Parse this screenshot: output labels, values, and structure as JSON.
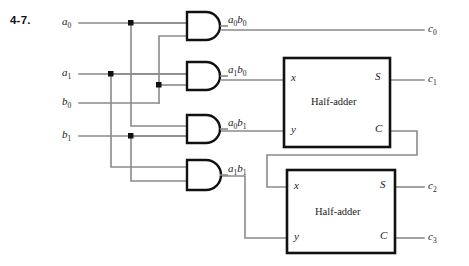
{
  "figure": {
    "problem_number": "4-7.",
    "wire_color": "#8a8a8a",
    "outline_color": "#111111",
    "background": "#ffffff"
  },
  "inputs": [
    {
      "name": "input-a0",
      "label": "a",
      "sub": "0"
    },
    {
      "name": "input-a1",
      "label": "a",
      "sub": "1"
    },
    {
      "name": "input-b0",
      "label": "b",
      "sub": "0"
    },
    {
      "name": "input-b1",
      "label": "b",
      "sub": "1"
    }
  ],
  "gates": [
    {
      "name": "and-gate-a0b0",
      "type": "AND",
      "output_label": "a",
      "output_sub": "0",
      "output_label2": "b",
      "output_sub2": "0"
    },
    {
      "name": "and-gate-a1b0",
      "type": "AND",
      "output_label": "a",
      "output_sub": "1",
      "output_label2": "b",
      "output_sub2": "0"
    },
    {
      "name": "and-gate-a0b1",
      "type": "AND",
      "output_label": "a",
      "output_sub": "0",
      "output_label2": "b",
      "output_sub2": "1"
    },
    {
      "name": "and-gate-a1b1",
      "type": "AND",
      "output_label": "a",
      "output_sub": "1",
      "output_label2": "b",
      "output_sub2": "1"
    }
  ],
  "half_adders": [
    {
      "name": "half-adder-upper",
      "title": "Half-adder",
      "port_x": "x",
      "port_y": "y",
      "port_s": "S",
      "port_c": "C"
    },
    {
      "name": "half-adder-lower",
      "title": "Half-adder",
      "port_x": "x",
      "port_y": "y",
      "port_s": "S",
      "port_c": "C"
    }
  ],
  "outputs": [
    {
      "name": "output-c0",
      "label": "c",
      "sub": "0"
    },
    {
      "name": "output-c1",
      "label": "c",
      "sub": "1"
    },
    {
      "name": "output-c2",
      "label": "c",
      "sub": "2"
    },
    {
      "name": "output-c3",
      "label": "c",
      "sub": "3"
    }
  ]
}
